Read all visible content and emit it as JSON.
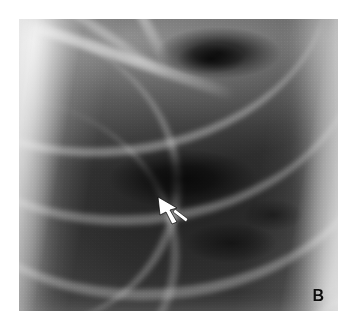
{
  "figure": {
    "kind": "chest-radiograph",
    "panel_label": "B",
    "modality": "Chest X-ray (plain radiograph)",
    "region": "Right upper and mid lung zone, close-up crop",
    "orientation": "Frontal (PA) projection",
    "background_color": "#ffffff"
  },
  "plate": {
    "left": 19,
    "top": 19,
    "width": 319,
    "height": 292,
    "tone_dark": "#1a1a1a",
    "tone_mid": "#6e6e6e",
    "tone_light": "#f2f2f2"
  },
  "annotations": {
    "arrow": {
      "name": "pointer-arrow",
      "color": "#ffffff",
      "outline_color": "#000000",
      "tip_x": 140,
      "tip_y": 179,
      "tail_x": 170,
      "tail_y": 203,
      "direction": "up-left",
      "points_to": "focal lucency / cavitary lesion in lung parenchyma"
    },
    "label": {
      "name": "panel-label",
      "text": "B",
      "color": "#0d0d0d",
      "corner": "bottom-right"
    }
  },
  "anatomy": {
    "features": [
      "posterior rib arcs sweeping inferolaterally",
      "clavicle and scapular border crossing at the apex",
      "lateral chest wall soft tissue (bright band, left edge)",
      "mediastinal / paraspinal border (bright band, right edge)",
      "dark oval lucency in the upper zone",
      "dark cavitary lucency at the arrow tip in the mid zone"
    ]
  }
}
